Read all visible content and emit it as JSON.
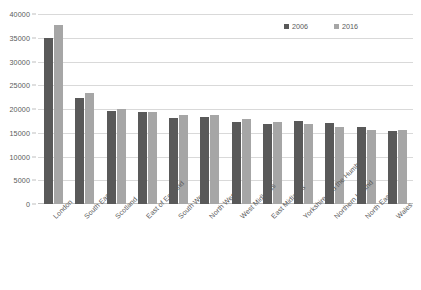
{
  "chart_data": {
    "type": "bar",
    "title": "",
    "subtitle": "",
    "xlabel": "",
    "ylabel": "",
    "ylim": [
      0,
      40000
    ],
    "ytick_interval": 5000,
    "yticks": [
      "40000",
      "35000",
      "30000",
      "25000",
      "20000",
      "15000",
      "10000",
      "5000",
      "0"
    ],
    "grid": true,
    "legend_position": "top-right",
    "categories": [
      "London",
      "South East",
      "Scotland",
      "East of England",
      "South West",
      "North West",
      "West Midlands",
      "East Midlands",
      "Yorkshire and the Humber",
      "Northern Ireland",
      "North East",
      "Wales"
    ],
    "series": [
      {
        "name": "2006",
        "color": "#595959",
        "values": [
          35000,
          22400,
          19500,
          19300,
          18200,
          18300,
          17200,
          16900,
          17500,
          17000,
          16200,
          15400
        ]
      },
      {
        "name": "2016",
        "color": "#a6a6a6",
        "values": [
          37600,
          23300,
          20100,
          19400,
          18700,
          18700,
          17800,
          17200,
          16800,
          16200,
          15600,
          15500
        ]
      }
    ]
  },
  "legend": {
    "items": [
      {
        "label": "2006",
        "color": "#595959"
      },
      {
        "label": "2016",
        "color": "#a6a6a6"
      }
    ]
  }
}
